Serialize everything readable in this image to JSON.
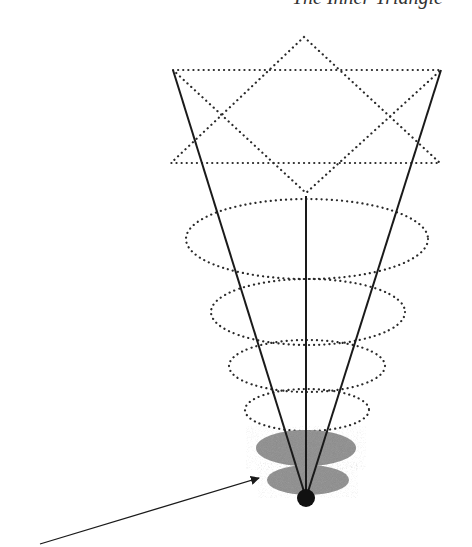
{
  "title": "The Inner Triangle",
  "colors": {
    "line": "#1a1a1a",
    "dotted": "#2a2a2a",
    "shaded": "#9a9a9a",
    "point": "#111111",
    "background": "#ffffff"
  },
  "diagram": {
    "star": {
      "up_triangle": [
        [
          304,
          37
        ],
        [
          171,
          163
        ],
        [
          440,
          163
        ]
      ],
      "down_triangle": [
        [
          173,
          70
        ],
        [
          441,
          70
        ],
        [
          306,
          193
        ]
      ]
    },
    "cone_lines": [
      {
        "from": [
          173,
          70
        ],
        "to": [
          306,
          498
        ]
      },
      {
        "from": [
          441,
          70
        ],
        "to": [
          306,
          498
        ]
      },
      {
        "from": [
          306,
          196
        ],
        "to": [
          306,
          498
        ]
      }
    ],
    "dotted_rings": [
      {
        "cx": 307,
        "cy": 239,
        "rx": 121,
        "ry": 40
      },
      {
        "cx": 308,
        "cy": 312,
        "rx": 97,
        "ry": 33
      },
      {
        "cx": 307,
        "cy": 366,
        "rx": 78,
        "ry": 26
      },
      {
        "cx": 307,
        "cy": 410,
        "rx": 62,
        "ry": 21
      }
    ],
    "shaded_discs": [
      {
        "cx": 306,
        "cy": 448,
        "rx": 50,
        "ry": 18
      },
      {
        "cx": 308,
        "cy": 480,
        "rx": 41,
        "ry": 15
      }
    ],
    "point": {
      "cx": 306,
      "cy": 498,
      "r": 9
    },
    "arrow": {
      "from": [
        40,
        544
      ],
      "to": [
        259,
        478
      ]
    }
  }
}
